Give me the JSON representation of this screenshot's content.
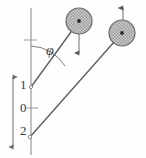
{
  "figure": {
    "kind": "physics-diagram",
    "background_color": "#fefefe",
    "stroke_color": "#555555",
    "text_color": "#3a3a3a",
    "mass_fill_color": "#b8b8b8",
    "mass_edge_color": "#6a6a6a",
    "mass_center_color": "#2b2b2b"
  },
  "angle": {
    "symbol": "φ",
    "label_x": 48,
    "label_y": 50
  },
  "scale_axis": {
    "x": 13,
    "y_top": 73,
    "y_bottom": 151,
    "arrowheads": "both",
    "ticks": [
      {
        "label": "1",
        "x": 19,
        "y": 84
      },
      {
        "label": "0",
        "x": 19,
        "y": 107
      },
      {
        "label": "2",
        "x": 19,
        "y": 130
      }
    ]
  },
  "vertical_axis": {
    "x": 31,
    "y_top": 8,
    "y_bottom": 155
  },
  "rods": [
    {
      "name": "rod-upper",
      "x1": 31,
      "y1": 87,
      "x2": 79,
      "y2": 21
    },
    {
      "name": "rod-lower",
      "x1": 30,
      "y1": 137,
      "x2": 122,
      "y2": 33
    }
  ],
  "masses": [
    {
      "name": "mass-left",
      "cx": 79,
      "cy": 21,
      "r": 13,
      "arrow": {
        "direction": "down",
        "x": 79,
        "y_start": 21,
        "y_end": 55
      }
    },
    {
      "name": "mass-right",
      "cx": 122,
      "cy": 33,
      "r": 13,
      "arrow": {
        "direction": "up",
        "x": 123,
        "y_start": 33,
        "y_end": 6
      }
    }
  ],
  "arc": {
    "name": "angle-arc",
    "center_x": 31,
    "center_y": 88,
    "radius": 42,
    "start_deg": 90,
    "end_deg": 54
  },
  "pivot_ticks": [
    {
      "name": "tick-upper",
      "x1": 25,
      "y1": 40,
      "x2": 37,
      "y2": 40
    },
    {
      "name": "tick-mid",
      "x1": 27,
      "y1": 108,
      "x2": 38,
      "y2": 108
    }
  ]
}
